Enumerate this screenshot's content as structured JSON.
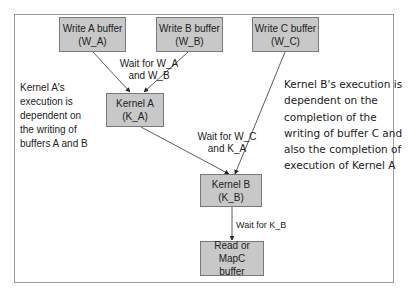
{
  "nodes": {
    "write_a": {
      "line1": "Write A buffer",
      "line2": "(W_A)"
    },
    "write_b": {
      "line1": "Write B buffer",
      "line2": "(W_B)"
    },
    "write_c": {
      "line1": "Write C buffer",
      "line2": "(W_C)"
    },
    "kernel_a": {
      "line1": "Kernel A",
      "line2": "(K_A)"
    },
    "kernel_b": {
      "line1": "Kernel B",
      "line2": "(K_B)"
    },
    "read_c": {
      "line1": "Read or MapC",
      "line2": "buffer"
    }
  },
  "edge_labels": {
    "wait_wa_wb": {
      "line1": "Wait for W_A",
      "line2": "and W_B"
    },
    "wait_wc_ka": {
      "line1": "Wait for W_C",
      "line2": "and K_A"
    },
    "wait_kb": {
      "line1": "Wait for K_B"
    }
  },
  "notes": {
    "kernel_a_note": [
      "Kernel A's",
      "execution is",
      "dependent on",
      "the writing of",
      "buffers A and B"
    ],
    "kernel_b_note": [
      "Kernel B's execution is",
      "dependent on the",
      "completion of the",
      "writing of buffer C and",
      "also the completion of",
      "execution of Kernel A"
    ]
  },
  "colors": {
    "node_fill": "#c8c8c8",
    "node_border": "#7a7a7a",
    "edge": "#333333",
    "frame": "#9a9a9a"
  }
}
